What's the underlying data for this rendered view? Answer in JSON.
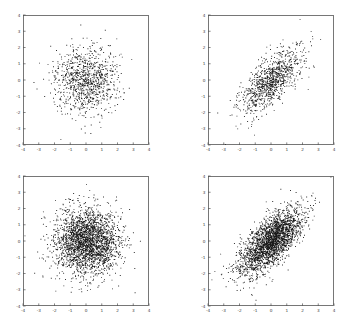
{
  "figure": {
    "background": "#ffffff",
    "layout": "2x2 grid of scatter plots",
    "panel_count": 4,
    "marker_color": "#1a1a1a",
    "frame_color": "#555555"
  },
  "chart_data": [
    {
      "type": "scatter",
      "title": "",
      "xlabel": "",
      "ylabel": "",
      "panel": "top-left",
      "xlim": [
        -4,
        4
      ],
      "ylim": [
        -4,
        4
      ],
      "xticks": [
        -4,
        -3,
        -2,
        -1,
        0,
        1,
        2,
        3,
        4
      ],
      "yticks": [
        -4,
        -3,
        -2,
        -1,
        0,
        1,
        2,
        3,
        4
      ],
      "xticklabels": [
        "-4",
        "-3",
        "-2",
        "-1",
        "0",
        "1",
        "2",
        "3",
        "4"
      ],
      "yticklabels": [
        "-4",
        "-3",
        "-2",
        "-1",
        "0",
        "1",
        "2",
        "3",
        "4"
      ],
      "grid": false,
      "legend": null,
      "n_points": 1000,
      "distribution": "bivariate gaussian",
      "mean": [
        0,
        0
      ],
      "sigma_x": 1.0,
      "sigma_y": 1.0,
      "correlation": 0.0,
      "seed": 11
    },
    {
      "type": "scatter",
      "title": "",
      "xlabel": "",
      "ylabel": "",
      "panel": "top-right",
      "xlim": [
        -4,
        4
      ],
      "ylim": [
        -4,
        4
      ],
      "xticks": [
        -4,
        -3,
        -2,
        -1,
        0,
        1,
        2,
        3,
        4
      ],
      "yticks": [
        -4,
        -3,
        -2,
        -1,
        0,
        1,
        2,
        3,
        4
      ],
      "xticklabels": [
        "-4",
        "-3",
        "-2",
        "-1",
        "0",
        "1",
        "2",
        "3",
        "4"
      ],
      "yticklabels": [
        "-4",
        "-3",
        "-2",
        "-1",
        "0",
        "1",
        "2",
        "3",
        "4"
      ],
      "grid": false,
      "legend": null,
      "n_points": 1000,
      "distribution": "bivariate gaussian",
      "mean": [
        0,
        0
      ],
      "sigma_x": 1.0,
      "sigma_y": 1.0,
      "correlation": 0.7,
      "seed": 23
    },
    {
      "type": "scatter",
      "title": "",
      "xlabel": "",
      "ylabel": "",
      "panel": "bottom-left",
      "xlim": [
        -4,
        4
      ],
      "ylim": [
        -4,
        4
      ],
      "xticks": [
        -4,
        -3,
        -2,
        -1,
        0,
        1,
        2,
        3,
        4
      ],
      "yticks": [
        -4,
        -3,
        -2,
        -1,
        0,
        1,
        2,
        3,
        4
      ],
      "xticklabels": [
        "-4",
        "-3",
        "-2",
        "-1",
        "0",
        "1",
        "2",
        "3",
        "4"
      ],
      "yticklabels": [
        "-4",
        "-3",
        "-2",
        "-1",
        "0",
        "1",
        "2",
        "3",
        "4"
      ],
      "grid": false,
      "legend": null,
      "n_points": 2600,
      "distribution": "bivariate gaussian",
      "mean": [
        0,
        0
      ],
      "sigma_x": 1.0,
      "sigma_y": 1.0,
      "correlation": 0.0,
      "seed": 37
    },
    {
      "type": "scatter",
      "title": "",
      "xlabel": "",
      "ylabel": "",
      "panel": "bottom-right",
      "xlim": [
        -4,
        4
      ],
      "ylim": [
        -4,
        4
      ],
      "xticks": [
        -4,
        -3,
        -2,
        -1,
        0,
        1,
        2,
        3,
        4
      ],
      "yticks": [
        -4,
        -3,
        -2,
        -1,
        0,
        1,
        2,
        3,
        4
      ],
      "xticklabels": [
        "-4",
        "-3",
        "-2",
        "-1",
        "0",
        "1",
        "2",
        "3",
        "4"
      ],
      "yticklabels": [
        "-4",
        "-3",
        "-2",
        "-1",
        "0",
        "1",
        "2",
        "3",
        "4"
      ],
      "grid": false,
      "legend": null,
      "n_points": 2600,
      "distribution": "bivariate gaussian",
      "mean": [
        0,
        0
      ],
      "sigma_x": 1.0,
      "sigma_y": 1.0,
      "correlation": 0.7,
      "seed": 59
    }
  ]
}
